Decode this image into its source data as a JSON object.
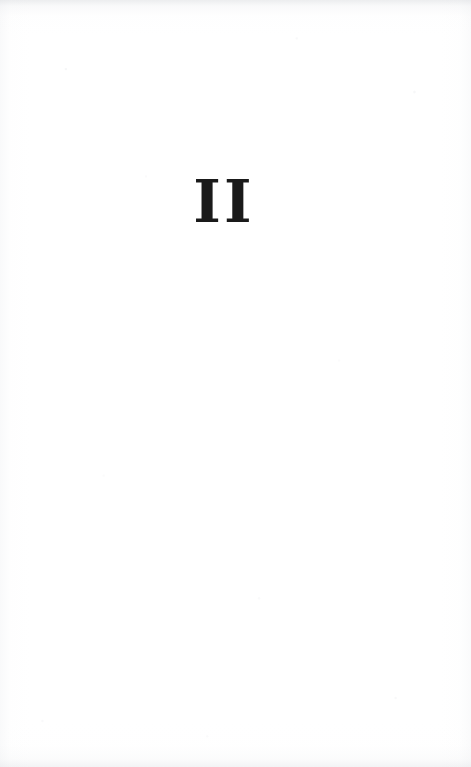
{
  "document": {
    "kind": "scanned-book-page",
    "page_type": "part-divider",
    "page_width": 471,
    "page_height": 767,
    "background_color": "#ffffff",
    "ink_color": "#1a1a1a",
    "has_header": false,
    "has_footer": false,
    "has_folio_number": false,
    "body_text": ""
  },
  "content": {
    "part_numeral": "II",
    "part_numeral_roman_value": 2,
    "numeral_system": "roman",
    "alignment": "center",
    "position": {
      "left_px": 200,
      "top_px": 185,
      "width_px": 45,
      "height_px": 42,
      "center_x_px": 222,
      "baseline_y_px": 227
    }
  }
}
